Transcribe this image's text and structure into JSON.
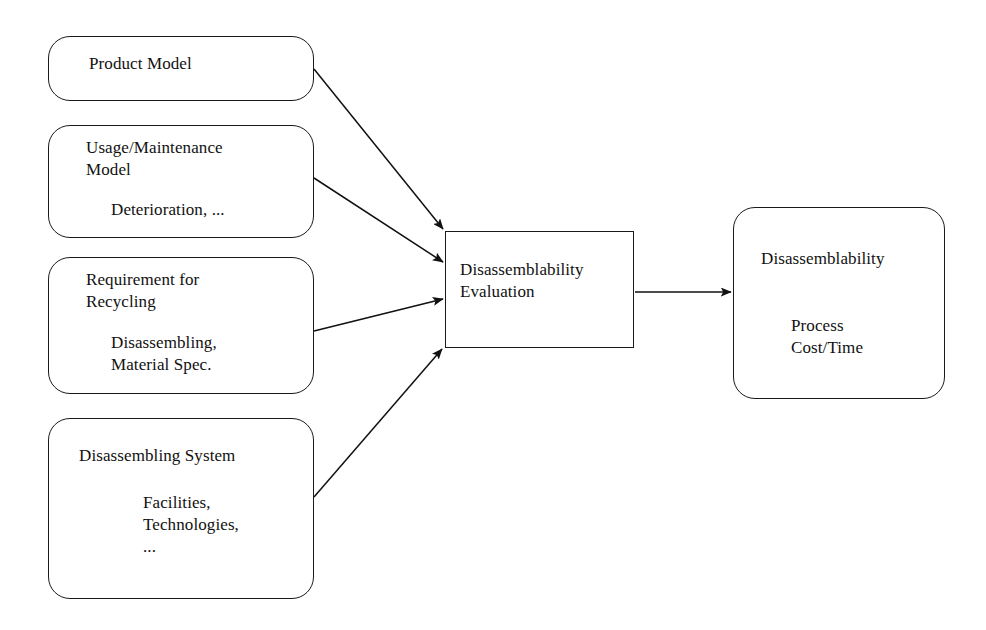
{
  "diagram": {
    "stroke_color": "#1a1a1a",
    "background_color": "#ffffff",
    "nodes": {
      "product_model": {
        "label": "Product Model",
        "shape": "rounded-rectangle"
      },
      "usage_maintenance": {
        "label": "Usage/Maintenance\nModel",
        "detail": "Deterioration, ...",
        "shape": "rounded-rectangle"
      },
      "requirement_recycling": {
        "label": "Requirement for\nRecycling",
        "detail": "Disassembling,\nMaterial Spec.",
        "shape": "rounded-rectangle"
      },
      "disassembling_system": {
        "label": "Disassembling System",
        "detail": "Facilities,\nTechnologies,\n...",
        "shape": "rounded-rectangle"
      },
      "evaluation": {
        "label": "Disassemblability\nEvaluation",
        "shape": "rectangle"
      },
      "output": {
        "label": "Disassemblability",
        "detail": "Process\nCost/Time",
        "shape": "rounded-rectangle"
      }
    },
    "edges": [
      {
        "from": "product_model",
        "to": "evaluation",
        "style": "arrow"
      },
      {
        "from": "usage_maintenance",
        "to": "evaluation",
        "style": "arrow"
      },
      {
        "from": "requirement_recycling",
        "to": "evaluation",
        "style": "arrow"
      },
      {
        "from": "disassembling_system",
        "to": "evaluation",
        "style": "arrow"
      },
      {
        "from": "evaluation",
        "to": "output",
        "style": "arrow"
      }
    ]
  }
}
